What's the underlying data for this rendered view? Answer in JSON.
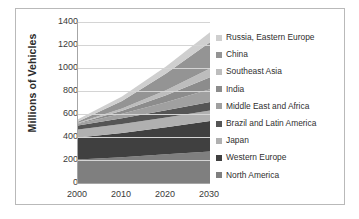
{
  "chart_data": {
    "type": "area",
    "stacked": true,
    "title": "",
    "xlabel": "",
    "ylabel": "Millions of Vehicles",
    "x": [
      2000,
      2010,
      2020,
      2030
    ],
    "xticklabels": [
      "2000",
      "2010",
      "2020",
      "2030"
    ],
    "xlim": [
      2000,
      2030
    ],
    "ylim": [
      0,
      1400
    ],
    "yticks": [
      0,
      200,
      400,
      600,
      800,
      1000,
      1200,
      1400
    ],
    "yticklabels": [
      "0",
      "200",
      "400",
      "600",
      "800",
      "1000",
      "1200",
      "1400"
    ],
    "grid": "horizontal",
    "legend_position": "right",
    "series": [
      {
        "name": "North America",
        "values": [
          205,
          225,
          250,
          275
        ],
        "color": "#7f7f7f"
      },
      {
        "name": "Western Europe",
        "values": [
          190,
          210,
          235,
          265
        ],
        "color": "#404040"
      },
      {
        "name": "Japan",
        "values": [
          70,
          78,
          85,
          90
        ],
        "color": "#b0b0b0"
      },
      {
        "name": "Brazil and Latin America",
        "values": [
          35,
          50,
          62,
          75
        ],
        "color": "#555555"
      },
      {
        "name": "Middle East and Africa",
        "values": [
          15,
          40,
          70,
          110
        ],
        "color": "#a0a0a0"
      },
      {
        "name": "India",
        "values": [
          5,
          25,
          60,
          105
        ],
        "color": "#8c8c8c"
      },
      {
        "name": "Southeast Asia",
        "values": [
          5,
          20,
          45,
          75
        ],
        "color": "#bdbdbd"
      },
      {
        "name": "China",
        "values": [
          10,
          65,
          145,
          230
        ],
        "color": "#949494"
      },
      {
        "name": "Russia, Eastern Europe",
        "values": [
          20,
          40,
          60,
          85
        ],
        "color": "#cfcfcf"
      }
    ],
    "totals": [
      555,
      753,
      1012,
      1310
    ]
  },
  "legend": {
    "items": [
      {
        "label": "Russia, Eastern Europe",
        "color": "#cfcfcf"
      },
      {
        "label": "China",
        "color": "#949494"
      },
      {
        "label": "Southeast Asia",
        "color": "#bdbdbd"
      },
      {
        "label": "India",
        "color": "#8c8c8c"
      },
      {
        "label": "Middle East and Africa",
        "color": "#a0a0a0"
      },
      {
        "label": "Brazil and Latin America",
        "color": "#555555"
      },
      {
        "label": "Japan",
        "color": "#b0b0b0"
      },
      {
        "label": "Western Europe",
        "color": "#404040"
      },
      {
        "label": "North America",
        "color": "#7f7f7f"
      }
    ]
  }
}
